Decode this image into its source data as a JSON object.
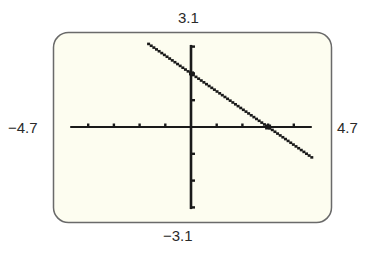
{
  "window": {
    "ymax_label": "3.1",
    "ymin_label": "−3.1",
    "xmin_label": "−4.7",
    "xmax_label": "4.7"
  },
  "colors": {
    "screen_background": "#fdfdf0",
    "frame_border": "#6a6a6a",
    "axis": "#1a1a1a",
    "graph_line": "#1a1a1a",
    "page_background": "#ffffff"
  },
  "chart_data": {
    "type": "line",
    "title": "",
    "xlabel": "",
    "ylabel": "",
    "xlim": [
      -4.7,
      4.7
    ],
    "ylim": [
      -3.1,
      3.1
    ],
    "x_tick_step": 1,
    "y_tick_step": 1,
    "x_ticks": [
      -4,
      -3,
      -2,
      -1,
      1,
      2,
      3,
      4
    ],
    "y_ticks": [
      -3,
      -2,
      -1,
      1,
      2,
      3
    ],
    "grid": false,
    "legend": null,
    "series": [
      {
        "name": "y = -2/3 x + 2",
        "slope": -0.6667,
        "y_intercept": 2,
        "x_intercept": 3,
        "x": [
          -1.65,
          0,
          3,
          4.7
        ],
        "y": [
          3.1,
          2,
          0,
          -1.13
        ],
        "style": "dotted-pixel"
      }
    ],
    "annotations": [
      {
        "text": "3.1",
        "position": "top"
      },
      {
        "text": "−3.1",
        "position": "bottom"
      },
      {
        "text": "−4.7",
        "position": "left"
      },
      {
        "text": "4.7",
        "position": "right"
      }
    ]
  }
}
